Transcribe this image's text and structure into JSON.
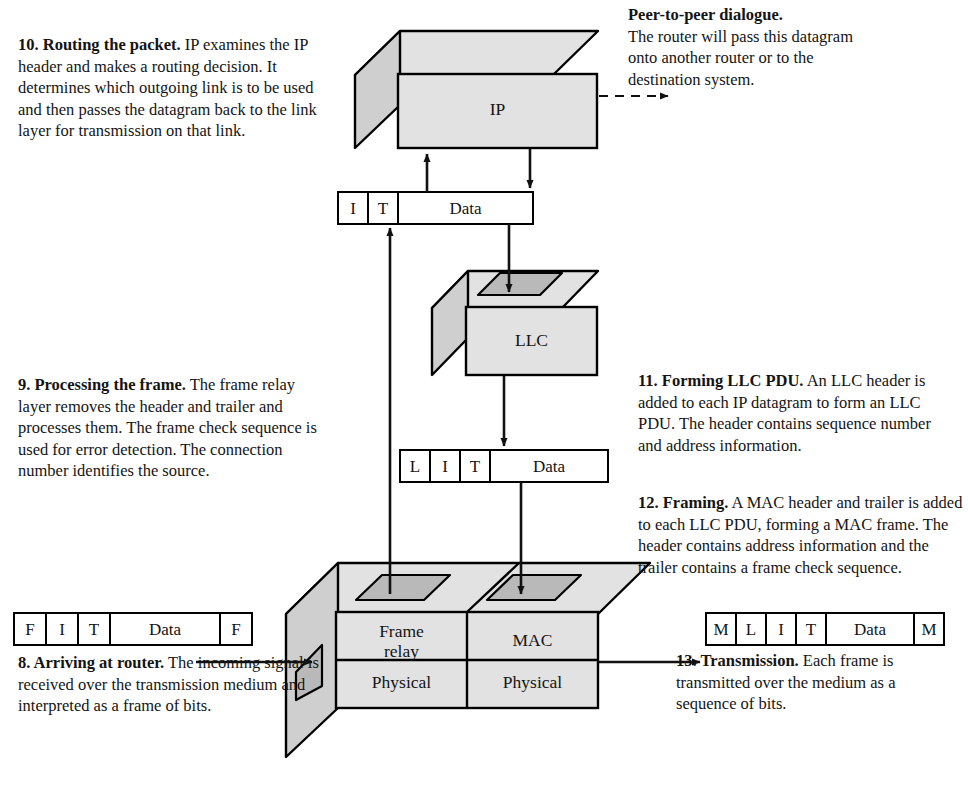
{
  "diagram": {
    "fill_color": "#e2e2e2",
    "side_color": "#cfcfcf",
    "hole_color": "#b9b9b9",
    "stroke_color": "#000000"
  },
  "boxes": {
    "ip": {
      "label": "IP"
    },
    "llc": {
      "label": "LLC"
    },
    "router": {
      "frame_relay": "Frame\nrelay",
      "frame_relay_line1": "Frame",
      "frame_relay_line2": "relay",
      "mac": "MAC",
      "physical_left": "Physical",
      "physical_right": "Physical"
    }
  },
  "packets": {
    "ip_datagram": {
      "name": "I-T-Data",
      "cells": [
        {
          "label": "I",
          "width": 30
        },
        {
          "label": "T",
          "width": 30
        },
        {
          "label": "Data",
          "width": 135
        }
      ]
    },
    "llc_pdu": {
      "name": "L-I-T-Data",
      "cells": [
        {
          "label": "L",
          "width": 30
        },
        {
          "label": "I",
          "width": 30
        },
        {
          "label": "T",
          "width": 30
        },
        {
          "label": "Data",
          "width": 118
        }
      ]
    },
    "incoming_frame": {
      "name": "F-I-T-Data-F",
      "cells": [
        {
          "label": "F",
          "width": 32
        },
        {
          "label": "I",
          "width": 32
        },
        {
          "label": "T",
          "width": 32
        },
        {
          "label": "Data",
          "width": 110
        },
        {
          "label": "F",
          "width": 32
        }
      ]
    },
    "outgoing_frame": {
      "name": "M-L-I-T-Data-M",
      "cells": [
        {
          "label": "M",
          "width": 30
        },
        {
          "label": "L",
          "width": 30
        },
        {
          "label": "I",
          "width": 30
        },
        {
          "label": "T",
          "width": 30
        },
        {
          "label": "Data",
          "width": 118
        },
        {
          "label": "M",
          "width": 30
        }
      ]
    }
  },
  "notes": {
    "step10": {
      "lead": "10. Routing the packet.",
      "body": " IP examines the IP header and makes a routing decision. It determines which outgoing link is to be used and then passes the datagram back to the link layer for transmission on that link."
    },
    "peer": {
      "lead": "Peer-to-peer dialogue.",
      "body": "The router will pass this datagram onto another router or to the destination system."
    },
    "step9": {
      "lead": "9. Processing the frame.",
      "body": " The frame relay layer removes the header and trailer and processes them. The frame check sequence is used for error detection. The connection number identifies the source."
    },
    "step11": {
      "lead": "11. Forming LLC PDU.",
      "body": " An LLC header is added to each IP datagram to form an LLC PDU. The header contains sequence number and address information."
    },
    "step12": {
      "lead": "12. Framing.",
      "body": " A MAC header and trailer is added to each LLC PDU, forming a MAC frame. The header contains address information and the trailer contains a frame check sequence."
    },
    "step8": {
      "lead": "8. Arriving at router.",
      "body": " The incoming signal is received over the transmission medium and interpreted as a frame of bits."
    },
    "step13": {
      "lead": "13. Transmission.",
      "body": " Each frame is transmitted over the medium as a sequence of bits."
    }
  },
  "arrows": {
    "peer_dialogue": "dashed-arrow-right",
    "ip_up": "arrow-up-into-ip",
    "ip_down": "arrow-down-from-ip",
    "llc_in": "arrow-down-into-llc",
    "llc_out": "arrow-down-from-llc",
    "mac_in": "arrow-down-into-mac",
    "frame_relay_up": "arrow-up-from-frame-relay",
    "incoming_signal": "arrow-right-into-physical",
    "outgoing_signal": "arrow-right-out-of-physical"
  }
}
